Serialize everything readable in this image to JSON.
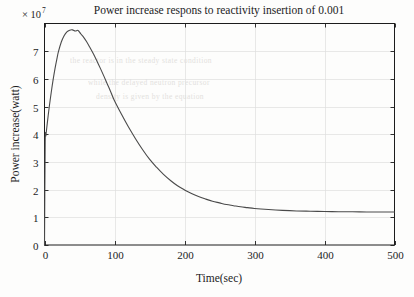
{
  "figure": {
    "background_color": "#fdfdfc",
    "axis_color": "#1c1c1c",
    "grid_color": "#dedede",
    "curve_color": "#4a4a4a"
  },
  "chart_data": {
    "type": "line",
    "title": "Power increase respons to reactivity insertion of 0.001",
    "xlabel": "Time(sec)",
    "ylabel": "Power increase(watt)",
    "y_multiplier_label": "× 10",
    "y_multiplier_exponent": "7",
    "y_multiplier_value": 10000000,
    "xlim": [
      0,
      500
    ],
    "ylim": [
      0,
      8
    ],
    "grid": true,
    "legend": "none",
    "xticks": [
      0,
      100,
      200,
      300,
      400,
      500
    ],
    "xtick_labels": [
      "0",
      "100",
      "200",
      "300",
      "400",
      "500"
    ],
    "yticks": [
      0,
      1,
      2,
      3,
      4,
      5,
      6,
      7
    ],
    "ytick_labels": [
      "0",
      "1",
      "2",
      "3",
      "4",
      "5",
      "6",
      "7"
    ],
    "series": [
      {
        "name": "Power increase",
        "units": "watt (×10^7)",
        "x": [
          0,
          1,
          2,
          3,
          4,
          5,
          6,
          8,
          10,
          12,
          15,
          18,
          20,
          24,
          28,
          32,
          36,
          40,
          44,
          48,
          52,
          56,
          60,
          65,
          70,
          75,
          80,
          85,
          90,
          95,
          100,
          110,
          120,
          130,
          140,
          150,
          160,
          170,
          180,
          190,
          200,
          210,
          220,
          230,
          240,
          250,
          260,
          270,
          280,
          290,
          300,
          320,
          340,
          360,
          380,
          400,
          420,
          440,
          460,
          480,
          500
        ],
        "y": [
          0.0,
          3.72,
          3.95,
          4.18,
          4.4,
          4.62,
          4.83,
          5.22,
          5.58,
          5.92,
          6.37,
          6.76,
          6.99,
          7.33,
          7.56,
          7.7,
          7.76,
          7.77,
          7.73,
          7.75,
          7.62,
          7.5,
          7.35,
          7.13,
          6.9,
          6.64,
          6.37,
          6.09,
          5.8,
          5.51,
          5.21,
          4.72,
          4.26,
          3.84,
          3.45,
          3.1,
          2.81,
          2.55,
          2.33,
          2.14,
          1.99,
          1.86,
          1.75,
          1.66,
          1.58,
          1.52,
          1.46,
          1.42,
          1.38,
          1.35,
          1.32,
          1.28,
          1.25,
          1.23,
          1.22,
          1.21,
          1.2,
          1.2,
          1.19,
          1.19,
          1.19
        ]
      }
    ],
    "annotations": {
      "prompt_jump_value": 3.72,
      "peak_value": 7.77,
      "peak_time": 42,
      "asymptote_value": 1.19
    }
  },
  "bleed_text": {
    "line1": "the reactor is in the steady state condition",
    "line2": "while the delayed neutron precursor",
    "line3": "density is given by the equation"
  }
}
